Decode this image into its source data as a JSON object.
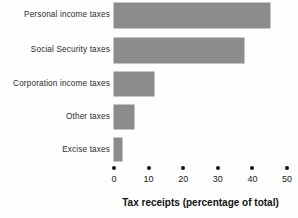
{
  "chart_data": {
    "type": "bar",
    "orientation": "horizontal",
    "title": "",
    "subtitle": "",
    "xlabel": "Tax receipts (percentage of total)",
    "ylabel": "",
    "categories": [
      "Personal income taxes",
      "Social Security taxes",
      "Corporation income taxes",
      "Other taxes",
      "Excise taxes"
    ],
    "values": [
      45,
      37.5,
      11.5,
      5.8,
      2.3
    ],
    "xlim": [
      0,
      50
    ],
    "xticks": [
      0,
      10,
      20,
      30,
      40,
      50
    ],
    "xticklabels": [
      "0",
      "10",
      "20",
      "30",
      "40",
      "50"
    ],
    "grid": false,
    "legend": false,
    "bar_color": "#8c8c8c",
    "text_color": "#2b2b2b",
    "tick_marker": "dot",
    "background": "#fefefe"
  },
  "axis": {
    "title": "Tax receipts (percentage of total)",
    "ticks": [
      {
        "value": "0"
      },
      {
        "value": "10"
      },
      {
        "value": "20"
      },
      {
        "value": "30"
      },
      {
        "value": "40"
      },
      {
        "value": "50"
      }
    ]
  },
  "bars": [
    {
      "label": "Personal income taxes",
      "value": 45
    },
    {
      "label": "Social Security taxes",
      "value": 37.5
    },
    {
      "label": "Corporation income taxes",
      "value": 11.5
    },
    {
      "label": "Other taxes",
      "value": 5.8
    },
    {
      "label": "Excise taxes",
      "value": 2.3
    }
  ]
}
